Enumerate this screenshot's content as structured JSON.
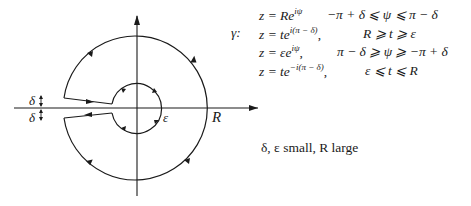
{
  "figure": {
    "type": "keyhole contour diagram",
    "labels": {
      "delta_upper": "δ",
      "delta_lower": "δ",
      "epsilon": "ε",
      "radius": "R"
    },
    "geometry": {
      "center": [
        137,
        108
      ],
      "outer_radius_px": 72,
      "inner_radius_px": 25,
      "gap_px": 10
    }
  },
  "definition": {
    "name": "γ:",
    "rows": [
      {
        "lhs": "z = Re",
        "sup": "iψ",
        "tail": "",
        "range": "−π + δ ⩽ ψ ⩽ π − δ"
      },
      {
        "lhs": "z = te",
        "sup": "i(π − δ)",
        "tail": ",",
        "range": "R ⩾ t ⩾ ε"
      },
      {
        "lhs": "z = εe",
        "sup": "iψ",
        "tail": ",",
        "range": "π − δ ⩾ ψ ⩾ −π + δ"
      },
      {
        "lhs": "z = te",
        "sup": "−i(π − δ)",
        "tail": ",",
        "range": "ε ⩽ t ⩽ R"
      }
    ]
  },
  "note": {
    "text": "δ, ε small, R large"
  }
}
